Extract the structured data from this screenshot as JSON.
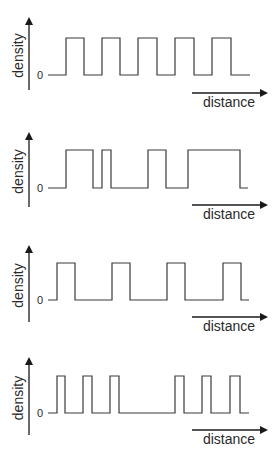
{
  "figure": {
    "y_axis_label": "density",
    "x_axis_label": "distance",
    "zero_label": "0",
    "colors": {
      "line": "#3a3a3a",
      "axis": "#1a1a1a",
      "background": "#ffffff"
    }
  },
  "panels": [
    {
      "id": "panel-1",
      "description": "regular, evenly spaced pulses of equal width",
      "pulses": [
        [
          66,
          84
        ],
        [
          102,
          120
        ],
        [
          138,
          157
        ],
        [
          175,
          194
        ],
        [
          212,
          231
        ]
      ],
      "line_start": 48,
      "line_end": 250,
      "baseline_y": 75,
      "high_y": 38,
      "axis_top": 17,
      "axis_bottom": 90,
      "distance_arrow_y": 93,
      "distance_label_y": 107
    },
    {
      "id": "panel-2",
      "description": "irregular pulses of varying width and spacing",
      "pulses": [
        [
          66,
          93
        ],
        [
          102,
          111
        ],
        [
          148,
          166
        ],
        [
          188,
          240
        ]
      ],
      "line_start": 48,
      "line_end": 248,
      "baseline_y": 188,
      "high_y": 150,
      "axis_top": 132,
      "axis_bottom": 207,
      "distance_arrow_y": 205,
      "distance_label_y": 219
    },
    {
      "id": "panel-3",
      "description": "regular pulses with wider spacing",
      "pulses": [
        [
          57,
          75
        ],
        [
          112,
          130
        ],
        [
          167,
          185
        ],
        [
          223,
          241
        ]
      ],
      "line_start": 48,
      "line_end": 249,
      "baseline_y": 300,
      "high_y": 263,
      "axis_top": 245,
      "axis_bottom": 322,
      "distance_arrow_y": 317,
      "distance_label_y": 331
    },
    {
      "id": "panel-4",
      "description": "clustered narrow pulses with a gap",
      "pulses": [
        [
          57,
          65
        ],
        [
          83,
          92
        ],
        [
          110,
          119
        ],
        [
          175,
          184
        ],
        [
          202,
          211
        ],
        [
          230,
          240
        ]
      ],
      "line_start": 48,
      "line_end": 249,
      "baseline_y": 413,
      "high_y": 376,
      "axis_top": 357,
      "axis_bottom": 435,
      "distance_arrow_y": 430,
      "distance_label_y": 444
    }
  ]
}
